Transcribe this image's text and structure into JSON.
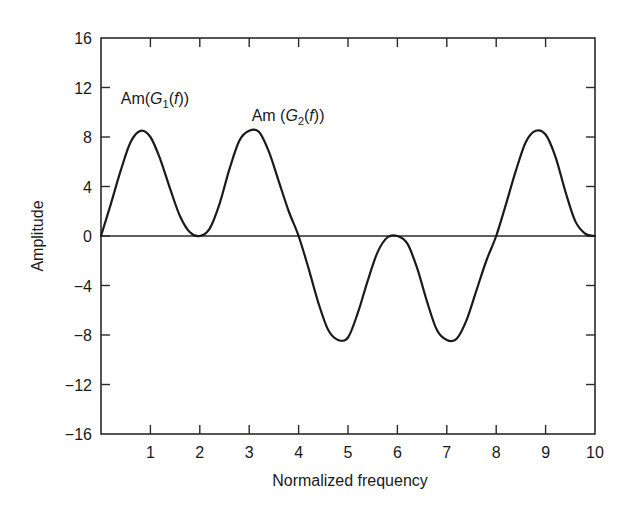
{
  "chart_data": {
    "type": "line",
    "title": "",
    "xlabel": "Normalized frequency",
    "ylabel": "Amplitude",
    "xlim": [
      0,
      10
    ],
    "ylim": [
      -16,
      16
    ],
    "x_ticks": [
      1,
      2,
      3,
      4,
      5,
      6,
      7,
      8,
      9,
      10
    ],
    "x_tick_labels": [
      "1",
      "2",
      "3",
      "4",
      "5",
      "6",
      "7",
      "8",
      "9",
      "10"
    ],
    "y_ticks": [
      16,
      12,
      8,
      4,
      0,
      -4,
      -8,
      -12,
      -16
    ],
    "y_tick_labels": [
      "16",
      "12",
      "8",
      "4",
      "0",
      "−4",
      "−8",
      "−12",
      "−16"
    ],
    "grid": false,
    "zero_line": true,
    "annotations": [
      {
        "text_prefix": "Am(",
        "text_italic": "G",
        "text_sub": "1",
        "text_mid": "(",
        "text_italic2": "f",
        "text_suffix": "))",
        "x": 0.4,
        "y": 10.7
      },
      {
        "text_prefix": "Am (",
        "text_italic": "G",
        "text_sub": "2",
        "text_mid": "(",
        "text_italic2": "f",
        "text_suffix": "))",
        "x": 3.05,
        "y": 9.3
      }
    ],
    "series": [
      {
        "name": "Amplitude",
        "color": "#1a1a1a",
        "x": [
          0,
          0.2,
          0.4,
          0.6,
          0.8,
          1.0,
          1.2,
          1.4,
          1.6,
          1.8,
          2.0,
          2.2,
          2.4,
          2.6,
          2.8,
          3.0,
          3.2,
          3.4,
          3.6,
          3.8,
          4.0,
          4.2,
          4.4,
          4.6,
          4.8,
          5.0,
          5.2,
          5.4,
          5.6,
          5.8,
          6.0,
          6.2,
          6.4,
          6.6,
          6.8,
          7.0,
          7.2,
          7.4,
          7.6,
          7.8,
          8.0,
          8.2,
          8.4,
          8.6,
          8.8,
          9.0,
          9.2,
          9.4,
          9.6,
          9.8,
          10.0
        ],
        "values": [
          0,
          2.6,
          5.3,
          7.6,
          8.5,
          8.0,
          6.2,
          3.8,
          1.6,
          0.3,
          0.0,
          0.6,
          2.6,
          5.4,
          7.7,
          8.5,
          8.4,
          6.8,
          4.4,
          2.0,
          0.0,
          -2.6,
          -5.4,
          -7.6,
          -8.4,
          -8.2,
          -6.2,
          -3.6,
          -1.3,
          -0.1,
          0.0,
          -0.6,
          -2.6,
          -5.3,
          -7.6,
          -8.4,
          -8.3,
          -6.8,
          -4.4,
          -2.0,
          0.0,
          2.6,
          5.3,
          7.6,
          8.5,
          8.2,
          6.4,
          3.6,
          1.2,
          0.2,
          0
        ]
      }
    ]
  }
}
